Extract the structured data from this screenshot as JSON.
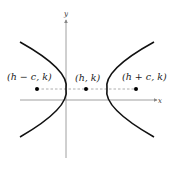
{
  "diagram": {
    "title": "",
    "axes": {
      "x_label": "x",
      "y_label": "y"
    },
    "points": [
      {
        "label": "(h − c, k)",
        "name": "left-focus"
      },
      {
        "label": "(h, k)",
        "name": "center"
      },
      {
        "label": "(h + c, k)",
        "name": "right-focus"
      }
    ],
    "colors": {
      "curve": "#111111",
      "axis": "#888888",
      "dashed": "#999999",
      "point": "#000000"
    }
  }
}
